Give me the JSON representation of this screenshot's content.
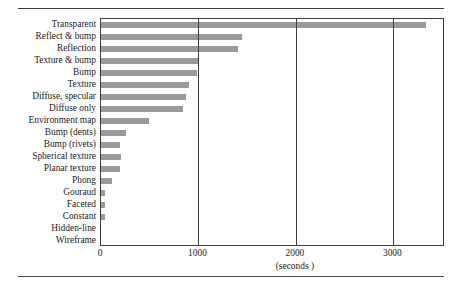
{
  "figure": {
    "clipped_caption_text": "",
    "axis_title": "(seconds )",
    "x_ticks": [
      {
        "label": "0",
        "value": 0
      },
      {
        "label": "1000",
        "value": 1000
      },
      {
        "label": "2000",
        "value": 2000
      },
      {
        "label": "3000",
        "value": 3000
      }
    ],
    "bar_color": "#9a9a9a",
    "frame_color": "#3c3c3c"
  },
  "chart_data": {
    "type": "bar",
    "orientation": "horizontal",
    "title": "",
    "xlabel": "(seconds )",
    "ylabel": "",
    "xlim": [
      0,
      3530
    ],
    "grid": true,
    "legend": "none",
    "categories": [
      "Transparent",
      "Reflect & bump",
      "Reflection",
      "Texture & bump",
      "Bump",
      "Texture",
      "Diffuse, specular",
      "Diffuse only",
      "Environment map",
      "Bump (dents)",
      "Bump (rivets)",
      "Spherical texture",
      "Planar texture",
      "Phong",
      "Gouraud",
      "Faceted",
      "Constant",
      "Hidden-line",
      "Wireframe"
    ],
    "values": [
      3330,
      1450,
      1410,
      1000,
      980,
      900,
      870,
      840,
      490,
      260,
      200,
      205,
      195,
      110,
      45,
      40,
      40,
      0,
      0
    ]
  }
}
